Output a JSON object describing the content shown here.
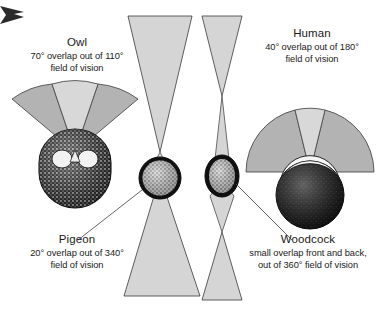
{
  "figure": {
    "width": 386,
    "height": 311,
    "background_color": "#ffffff"
  },
  "colors": {
    "monocular_cone": "#d5d5d5",
    "binocular_overlap": "#e2e2e2",
    "fan_side_lobe": "#b3b3b3",
    "fan_center_wedge": "#d8d8d8",
    "outline": "#4d4d4d",
    "leader_line": "#555555",
    "text": "#1a1a1a",
    "head_dark": "#141414",
    "head_speckle": "#cfcfcf"
  },
  "corner_marker": {
    "name": "arrow-marker",
    "color": "#2b2b2b"
  },
  "subjects": [
    {
      "id": "owl",
      "name": "Owl",
      "overlap_degrees": 70,
      "total_field_degrees": 110,
      "line1": "70° overlap out of 110°",
      "line2": "field of vision",
      "vision_shape": "forward-fan",
      "has_leader_line": false
    },
    {
      "id": "pigeon",
      "name": "Pigeon",
      "overlap_degrees": 20,
      "total_field_degrees": 340,
      "line1": "20° overlap out of 340°",
      "line2": "field of vision",
      "vision_shape": "hourglass-cones",
      "has_leader_line": true
    },
    {
      "id": "woodcock",
      "name": "Woodcock",
      "overlap_degrees": null,
      "total_field_degrees": 360,
      "line1": "small overlap front and back,",
      "line2": "out of 360° field of vision",
      "vision_shape": "narrow-double-cones",
      "has_leader_line": true
    },
    {
      "id": "human",
      "name": "Human",
      "overlap_degrees": 40,
      "total_field_degrees": 180,
      "line1": "40° overlap out of 180°",
      "line2": "field of vision",
      "vision_shape": "forward-fan",
      "has_leader_line": false
    }
  ]
}
